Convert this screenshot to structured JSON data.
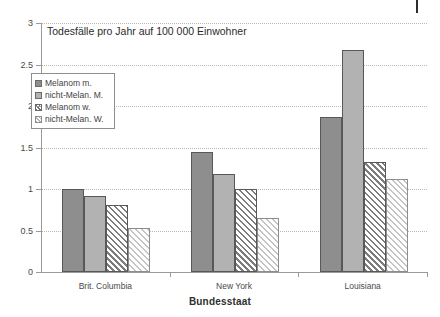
{
  "chart_data": {
    "type": "bar",
    "title": "Todesfälle pro Jahr auf 100 000 Einwohner",
    "xlabel": "Bundesstaat",
    "ylabel": "",
    "categories": [
      "Brit. Columbia",
      "New York",
      "Louisiana"
    ],
    "series": [
      {
        "name": "Melanom m.",
        "values": [
          1.0,
          1.44,
          1.87
        ],
        "color": "#8e8e8e",
        "pattern": "solid-dark"
      },
      {
        "name": "nicht-Melan. M.",
        "values": [
          0.91,
          1.18,
          2.68
        ],
        "color": "#b2b2b2",
        "pattern": "solid-light"
      },
      {
        "name": "Melanom w.",
        "values": [
          0.81,
          1.0,
          1.33
        ],
        "color": "#e9e9e9",
        "pattern": "hatch-dark"
      },
      {
        "name": "nicht-Melan. W.",
        "values": [
          0.53,
          0.65,
          1.12
        ],
        "color": "#f3f3f3",
        "pattern": "hatch-light"
      }
    ],
    "ylim": [
      0,
      3
    ],
    "yticks": [
      0,
      0.5,
      1,
      1.5,
      2,
      2.5,
      3
    ],
    "ytick_labels": [
      "0",
      "0.5",
      "1",
      "1.5",
      "2",
      "2.5",
      "3"
    ],
    "grid": true,
    "legend_position": "inside-upper-left"
  }
}
